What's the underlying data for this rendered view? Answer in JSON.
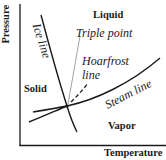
{
  "diagram": {
    "type": "phase-diagram",
    "axes": {
      "x_label": "Temperature",
      "y_label": "Pressure"
    },
    "regions": {
      "liquid": "Liquid",
      "solid": "Solid",
      "vapor": "Vapor"
    },
    "curve_labels": {
      "ice_line": "Ice line",
      "steam_line": "Steam line",
      "hoarfrost_line_1": "Hoarfrost",
      "hoarfrost_line_2": "line",
      "triple_point": "Triple point"
    },
    "colors": {
      "ink": "#1a1a1a",
      "pointer": "#8a8a8a",
      "background": "#ffffff"
    }
  }
}
